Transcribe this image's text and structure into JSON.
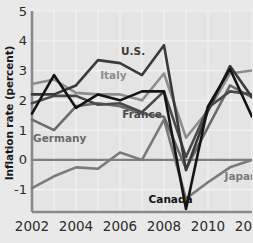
{
  "chart_data": {
    "type": "line",
    "title": "",
    "xlabel": "",
    "ylabel": "Inflation rate (percent)",
    "xlim": [
      2002,
      2012
    ],
    "ylim": [
      -1.75,
      5
    ],
    "grid": true,
    "legend_position": "inline-annotations",
    "x": [
      2002,
      2003,
      2004,
      2005,
      2006,
      2007,
      2008,
      2009,
      2010,
      2011,
      2012
    ],
    "xticks": [
      "2002",
      "2004",
      "2006",
      "2008",
      "2010",
      "2012"
    ],
    "xtick_values": [
      2002,
      2004,
      2006,
      2008,
      2010,
      2012
    ],
    "yticks": [
      "5",
      "4",
      "3",
      "2",
      "1",
      "0",
      "-1"
    ],
    "ytick_values": [
      5,
      4,
      3,
      2,
      1,
      0,
      -1
    ],
    "series": [
      {
        "name": "U.S.",
        "color": "#3a3a3a",
        "label_x": 2006.05,
        "label_y": 3.52,
        "values": [
          2.2,
          2.2,
          2.5,
          3.35,
          3.25,
          2.85,
          3.85,
          -0.35,
          1.65,
          3.15,
          2.1
        ]
      },
      {
        "name": "Italy",
        "color": "#8d8d8d",
        "label_x": 2005.1,
        "label_y": 2.7,
        "values": [
          2.55,
          2.7,
          2.25,
          2.2,
          2.2,
          2.0,
          2.9,
          0.75,
          1.65,
          2.9,
          3.0
        ]
      },
      {
        "name": "France",
        "color": "#4a4a4a",
        "label_x": 2006.1,
        "label_y": 1.4,
        "values": [
          1.9,
          2.15,
          2.15,
          1.85,
          1.9,
          1.6,
          2.3,
          0.1,
          1.75,
          2.3,
          2.2
        ]
      },
      {
        "name": "Germany",
        "color": "#6b6b6b",
        "label_x": 2002.05,
        "label_y": 0.6,
        "values": [
          1.35,
          1.0,
          1.8,
          1.9,
          1.8,
          1.55,
          1.45,
          -0.3,
          1.1,
          2.5,
          2.1
        ]
      },
      {
        "name": "Canada",
        "color": "#141414",
        "label_x": 2007.3,
        "label_y": -1.45,
        "values": [
          1.55,
          2.85,
          1.75,
          2.2,
          2.0,
          2.3,
          2.3,
          -1.65,
          1.8,
          3.05,
          1.45
        ]
      },
      {
        "name": "Japan",
        "color": "#7a7a7a",
        "label_x": 2010.75,
        "label_y": -0.68,
        "values": [
          -0.95,
          -0.55,
          -0.25,
          -0.3,
          0.25,
          0.0,
          1.35,
          -1.3,
          -0.75,
          -0.25,
          0.0
        ]
      }
    ]
  },
  "style": {
    "background": "#e9e9e9",
    "plot_background": "#e4e4e4",
    "grid_color": "#f2f2f2",
    "axis_color": "#8a8a8a",
    "zero_line_color": "#7e7e7e",
    "tick_text_color": "#2b2b2b"
  }
}
